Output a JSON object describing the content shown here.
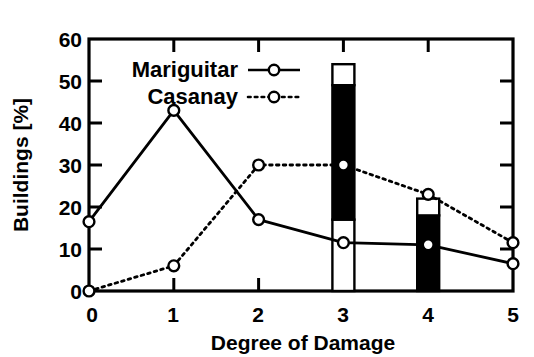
{
  "chart_data": {
    "type": "line",
    "title": "",
    "subtitle": "",
    "xlabel": "Degree of Damage",
    "ylabel": "Buildings [%]",
    "x": [
      0,
      1,
      2,
      3,
      4,
      5
    ],
    "xticklabels": [
      "0",
      "1",
      "2",
      "3",
      "4",
      "5"
    ],
    "yticklabels": [
      "0",
      "10",
      "20",
      "30",
      "40",
      "50",
      "60"
    ],
    "yticks": [
      0,
      10,
      20,
      30,
      40,
      50,
      60
    ],
    "xlim": [
      0,
      5
    ],
    "ylim": [
      0,
      60
    ],
    "grid": false,
    "legend_position": "upper-left-inside",
    "series": [
      {
        "name": "Mariguitar",
        "style": "solid",
        "marker": "open-circle",
        "color": "#000000",
        "values": [
          16.5,
          43,
          17,
          11.5,
          11,
          6.5
        ]
      },
      {
        "name": "Casanay",
        "style": "dotted",
        "marker": "open-circle",
        "color": "#000000",
        "values": [
          0,
          6,
          30,
          30,
          23,
          11.5
        ]
      }
    ],
    "bars": [
      {
        "x": 3,
        "segments": [
          {
            "from": 0,
            "to": 17,
            "fill": "white"
          },
          {
            "from": 17,
            "to": 49,
            "fill": "black"
          },
          {
            "from": 49,
            "to": 54,
            "fill": "white"
          }
        ]
      },
      {
        "x": 4,
        "segments": [
          {
            "from": 0,
            "to": 18,
            "fill": "black"
          },
          {
            "from": 18,
            "to": 22,
            "fill": "white"
          }
        ]
      }
    ]
  },
  "legend": {
    "entries": [
      {
        "label": "Mariguitar",
        "style": "solid"
      },
      {
        "label": "Casanay",
        "style": "dotted"
      }
    ]
  },
  "axes": {
    "x_title": "Degree of Damage",
    "y_title": "Buildings [%]",
    "x_ticks": [
      "0",
      "1",
      "2",
      "3",
      "4",
      "5"
    ],
    "y_ticks": [
      "0",
      "10",
      "20",
      "30",
      "40",
      "50",
      "60"
    ]
  }
}
